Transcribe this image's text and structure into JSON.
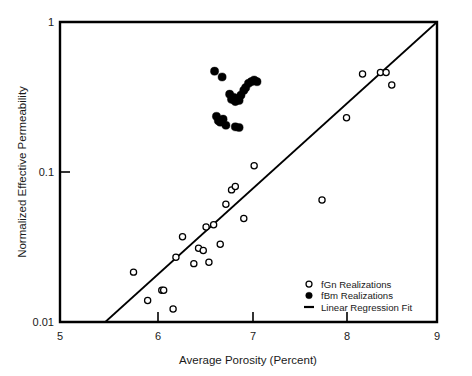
{
  "chart_data": {
    "type": "scatter",
    "title": "",
    "xlabel": "Average Porosity (Percent)",
    "ylabel": "Normalized Effective Permeability",
    "xlim": [
      5,
      9
    ],
    "ylim": [
      0.01,
      1
    ],
    "xscale": "linear",
    "yscale": "log",
    "grid": false,
    "xticks": [
      5,
      6,
      7,
      8,
      9
    ],
    "xtick_labels": [
      "5",
      "6",
      "7",
      "8",
      "9"
    ],
    "yticks": [
      1,
      0.1,
      0.01
    ],
    "ytick_labels": [
      "1",
      "0.1",
      "0.01"
    ],
    "legend_position": "lower right",
    "series": [
      {
        "name": "fGn Realizations",
        "marker": "open-circle",
        "color": "#000000",
        "points": [
          [
            5.78,
            0.0215
          ],
          [
            5.93,
            0.0139
          ],
          [
            6.08,
            0.0163
          ],
          [
            6.1,
            0.0163
          ],
          [
            6.2,
            0.0122
          ],
          [
            6.23,
            0.027
          ],
          [
            6.3,
            0.037
          ],
          [
            6.42,
            0.0245
          ],
          [
            6.47,
            0.031
          ],
          [
            6.52,
            0.03
          ],
          [
            6.55,
            0.043
          ],
          [
            6.58,
            0.025
          ],
          [
            6.63,
            0.0445
          ],
          [
            6.7,
            0.033
          ],
          [
            6.76,
            0.061
          ],
          [
            6.82,
            0.076
          ],
          [
            6.86,
            0.08
          ],
          [
            6.95,
            0.049
          ],
          [
            7.06,
            0.11
          ],
          [
            7.78,
            0.065
          ],
          [
            8.04,
            0.23
          ],
          [
            8.21,
            0.45
          ],
          [
            8.4,
            0.46
          ],
          [
            8.46,
            0.46
          ],
          [
            8.52,
            0.38
          ]
        ]
      },
      {
        "name": "fBm Realizations",
        "marker": "filled-circle",
        "color": "#000000",
        "points": [
          [
            6.64,
            0.47
          ],
          [
            6.72,
            0.43
          ],
          [
            6.8,
            0.33
          ],
          [
            6.82,
            0.305
          ],
          [
            6.84,
            0.315
          ],
          [
            6.86,
            0.295
          ],
          [
            6.88,
            0.31
          ],
          [
            6.9,
            0.3
          ],
          [
            6.92,
            0.325
          ],
          [
            6.95,
            0.35
          ],
          [
            6.97,
            0.365
          ],
          [
            7.0,
            0.39
          ],
          [
            7.03,
            0.4
          ],
          [
            7.06,
            0.41
          ],
          [
            7.09,
            0.4
          ],
          [
            6.66,
            0.235
          ],
          [
            6.68,
            0.22
          ],
          [
            6.7,
            0.215
          ],
          [
            6.73,
            0.225
          ],
          [
            6.76,
            0.205
          ],
          [
            6.86,
            0.2
          ],
          [
            6.9,
            0.198
          ]
        ]
      }
    ],
    "fit": {
      "name": "Linear Regression Fit",
      "style": "solid",
      "color": "#000000",
      "endpoints": [
        [
          5.48,
          0.01
        ],
        [
          9.0,
          1.0
        ]
      ]
    },
    "legend": [
      {
        "label": "fGn Realizations",
        "marker": "open-circle"
      },
      {
        "label": "fBm Realizations",
        "marker": "filled-circle"
      },
      {
        "label": "Linear Regression Fit",
        "marker": "line"
      }
    ]
  }
}
